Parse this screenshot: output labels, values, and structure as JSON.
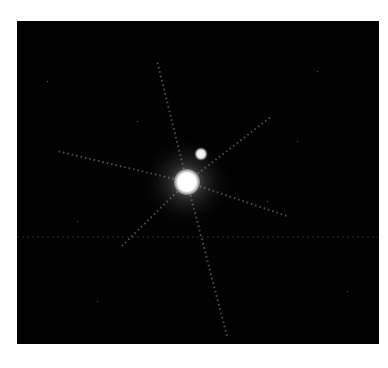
{
  "image": {
    "description": "Astronomical image: bright star with diffraction spikes and a faint companion on a black background",
    "background_color": "#020202",
    "page_background": "#ffffff",
    "primary_star": {
      "x": 170,
      "y": 161,
      "radius": 13,
      "color": "#ffffff"
    },
    "companion_star": {
      "x": 184,
      "y": 133,
      "radius": 5,
      "color": "#f2f2f2"
    }
  }
}
